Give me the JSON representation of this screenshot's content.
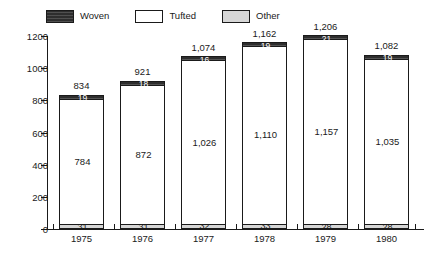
{
  "chart_data": {
    "type": "bar",
    "stacked": true,
    "title": "",
    "subtitle": "",
    "xlabel": "",
    "ylabel": "",
    "categories": [
      "1975",
      "1976",
      "1977",
      "1978",
      "1979",
      "1980"
    ],
    "ylim": [
      0,
      1200
    ],
    "yticks": [
      0,
      200,
      400,
      600,
      800,
      1000,
      1200
    ],
    "ytick_labels": [
      "0",
      "200",
      "400",
      "600",
      "800",
      "1000",
      "1200"
    ],
    "grid": false,
    "legend_position": "top-left",
    "series": [
      {
        "name": "Woven",
        "color": "#2e2e2e",
        "values": [
          19,
          18,
          16,
          19,
          21,
          19
        ],
        "labels": [
          "19",
          "18",
          "16",
          "19",
          "21",
          "19"
        ]
      },
      {
        "name": "Tufted",
        "color": "#ffffff",
        "values": [
          784,
          872,
          1026,
          1110,
          1157,
          1035
        ],
        "labels": [
          "784",
          "872",
          "1,026",
          "1,110",
          "1,157",
          "1,035"
        ]
      },
      {
        "name": "Other",
        "color": "#d6d6d6",
        "values": [
          31,
          31,
          32,
          33,
          28,
          28
        ],
        "labels": [
          "31",
          "31",
          "32",
          "33",
          "28",
          "28"
        ]
      }
    ],
    "totals": [
      834,
      921,
      1074,
      1162,
      1206,
      1082
    ],
    "total_labels": [
      "834",
      "921",
      "1,074",
      "1,162",
      "1,206",
      "1,082"
    ]
  },
  "legend": {
    "items": [
      {
        "label": "Woven",
        "swatch": "dark-swatch"
      },
      {
        "label": "Tufted",
        "swatch": "white-swatch"
      },
      {
        "label": "Other",
        "swatch": "gray-swatch"
      }
    ]
  },
  "axis": {
    "y_labels": [
      "1200",
      "1000",
      "800",
      "600",
      "400",
      "200",
      "0"
    ],
    "x_labels": [
      "1975",
      "1976",
      "1977",
      "1978",
      "1979",
      "1980"
    ]
  }
}
